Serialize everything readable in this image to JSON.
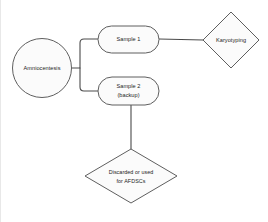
{
  "diagram": {
    "colors": {
      "stroke": "#5f5f5f",
      "fill": "#fbfbfb",
      "connector": "#4a4a4a",
      "text": "#242424",
      "background": "#ffffff"
    },
    "nodes": [
      {
        "id": "amniocentesis",
        "shape": "circle",
        "label": "Amniocentesis",
        "cx": 41,
        "cy": 68,
        "r": 29.5
      },
      {
        "id": "sample-1",
        "shape": "rounded-rectangle",
        "label": "Sample 1",
        "x": 97,
        "y": 26,
        "width": 61,
        "height": 27
      },
      {
        "id": "sample-2",
        "shape": "rounded-rectangle",
        "label_line_1": "Sample 2",
        "label_line_2": "(backup)",
        "x": 97,
        "y": 77,
        "width": 61,
        "height": 28
      },
      {
        "id": "karyotyping",
        "shape": "diamond",
        "label": "Karyotyping",
        "cx": 230,
        "cy": 40,
        "half_width": 28,
        "half_height": 28
      },
      {
        "id": "discarded",
        "shape": "diamond",
        "label_line_1": "Discarded or used",
        "label_line_2": "for AFDSCs",
        "cx": 130,
        "cy": 176,
        "half_width": 46,
        "half_height": 27
      }
    ],
    "edges": [
      {
        "id": "amniocentesis-to-sample-1",
        "from": "amniocentesis",
        "to": "sample-1",
        "path": "M 70.5 68 L 79 68 L 79 43 Q 79 39 83 39 L 97 39"
      },
      {
        "id": "amniocentesis-to-sample-2",
        "from": "amniocentesis",
        "to": "sample-2",
        "path": "M 79 68 L 79 87 Q 79 91 83 91 L 97 91"
      },
      {
        "id": "sample-1-to-karyotyping",
        "from": "sample-1",
        "to": "karyotyping",
        "path": "M 158 39 L 202 40"
      },
      {
        "id": "sample-2-to-discarded",
        "from": "sample-2",
        "to": "discarded",
        "path": "M 130 105 L 130 149"
      }
    ]
  }
}
